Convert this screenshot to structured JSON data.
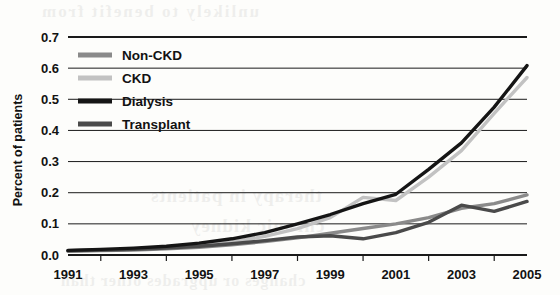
{
  "chart_data": {
    "type": "line",
    "title": "",
    "xlabel": "",
    "ylabel": "Percent of patients",
    "x": [
      1991,
      1992,
      1993,
      1994,
      1995,
      1996,
      1997,
      1998,
      1999,
      2000,
      2001,
      2002,
      2003,
      2004,
      2005
    ],
    "xtick_labels": [
      "1991",
      "1993",
      "1995",
      "1997",
      "1999",
      "2001",
      "2003",
      "2005"
    ],
    "xtick_values": [
      1991,
      1993,
      1995,
      1997,
      1999,
      2001,
      2003,
      2005
    ],
    "xlim": [
      1991,
      2005
    ],
    "ylim": [
      0.0,
      0.7
    ],
    "ytick_labels": [
      "0.0",
      "0.1",
      "0.2",
      "0.3",
      "0.4",
      "0.5",
      "0.6",
      "0.7"
    ],
    "ytick_values": [
      0.0,
      0.1,
      0.2,
      0.3,
      0.4,
      0.5,
      0.6,
      0.7
    ],
    "grid": true,
    "grid_axis": "y",
    "legend_position": "upper-left",
    "series": [
      {
        "name": "Non-CKD",
        "color": "#8a8a8a",
        "values": [
          0.012,
          0.014,
          0.016,
          0.02,
          0.025,
          0.033,
          0.043,
          0.055,
          0.07,
          0.085,
          0.1,
          0.12,
          0.15,
          0.165,
          0.193
        ]
      },
      {
        "name": "CKD",
        "color": "#c2c2c2",
        "values": [
          0.013,
          0.015,
          0.018,
          0.023,
          0.03,
          0.042,
          0.06,
          0.085,
          0.12,
          0.185,
          0.175,
          0.25,
          0.335,
          0.455,
          0.57
        ]
      },
      {
        "name": "Dialysis",
        "color": "#151515",
        "values": [
          0.015,
          0.018,
          0.022,
          0.028,
          0.038,
          0.052,
          0.072,
          0.1,
          0.13,
          0.165,
          0.195,
          0.275,
          0.36,
          0.475,
          0.608
        ]
      },
      {
        "name": "Transplant",
        "color": "#4a4a4a",
        "values": [
          0.014,
          0.016,
          0.018,
          0.022,
          0.028,
          0.036,
          0.046,
          0.058,
          0.062,
          0.052,
          0.072,
          0.105,
          0.16,
          0.14,
          0.172
        ]
      }
    ]
  },
  "legend": {
    "items": [
      {
        "label": "Non-CKD",
        "color": "#8a8a8a"
      },
      {
        "label": "CKD",
        "color": "#c2c2c2"
      },
      {
        "label": "Dialysis",
        "color": "#151515"
      },
      {
        "label": "Transplant",
        "color": "#4a4a4a"
      }
    ]
  },
  "axes": {
    "y_label": "Percent of patients"
  },
  "bleed_through": {
    "line_a": "unlikely to benefit from",
    "line_b": "therapy in patients",
    "line_c": "chronic kidney",
    "line_d": "changes or upgrades other than"
  }
}
